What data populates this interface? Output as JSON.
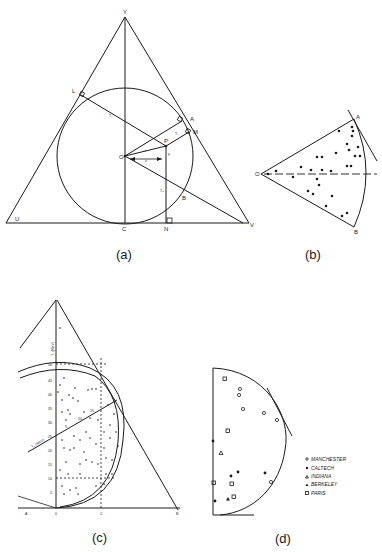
{
  "figure": {
    "panels": [
      {
        "id": "a",
        "caption": "(a)",
        "title": "Equilateral triangle with inscribed circle",
        "point_labels": {
          "Y": "Y",
          "L": "L",
          "A": "A",
          "M": "M",
          "P": "P",
          "O": "O",
          "B": "B",
          "U": "U",
          "C": "C",
          "N": "N",
          "V": "V",
          "T1": "T₁",
          "T2": "T₂",
          "T3": "T₃",
          "r": "r",
          "x": "x",
          "y": "y"
        }
      },
      {
        "id": "b",
        "caption": "(b)",
        "title": "Sector OAB with scattered data points",
        "point_labels": {
          "O": "O",
          "A": "A",
          "B": "B"
        }
      },
      {
        "id": "c",
        "caption": "(c)",
        "title": "Triangle plot with energy axes",
        "axis_labels": {
          "vertical": "T₁ (MeV)",
          "diagonal": "T₂ (MeV)"
        },
        "vertical_ticks": [
          "5",
          "10",
          "15",
          "20",
          "25",
          "30",
          "35",
          "40",
          "45",
          "50"
        ],
        "diagonal_ticks": [
          "5",
          "10",
          "15"
        ],
        "corner_labels": {
          "left": "A",
          "origin": "0",
          "mid": "C",
          "right": "B"
        }
      },
      {
        "id": "d",
        "caption": "(d)",
        "title": "Half-disc plot by laboratory",
        "legend": [
          {
            "symbol": "open-circle",
            "label": "MANCHESTER"
          },
          {
            "symbol": "filled-circle",
            "label": "CALTECH"
          },
          {
            "symbol": "open-triangle",
            "label": "INDIANA"
          },
          {
            "symbol": "filled-triangle",
            "label": "BERKELEY"
          },
          {
            "symbol": "open-square",
            "label": "PARIS"
          }
        ]
      }
    ]
  }
}
